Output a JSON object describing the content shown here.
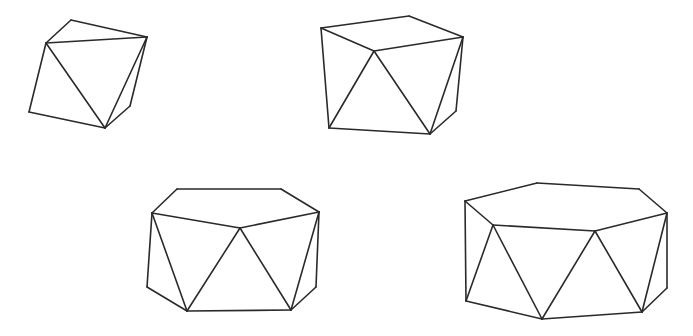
{
  "figure": {
    "background": "#ffffff",
    "stroke": "#2a2a2a",
    "polyhedra": [
      {
        "name": "polyhedron-1",
        "vertices": [
          [
            71,
            20
          ],
          [
            46,
            43
          ],
          [
            147,
            37
          ],
          [
            29,
            112
          ],
          [
            105,
            128
          ],
          [
            130,
            106
          ]
        ],
        "edges": [
          [
            0,
            2
          ],
          [
            0,
            1
          ],
          [
            1,
            2
          ],
          [
            1,
            3
          ],
          [
            3,
            4
          ],
          [
            1,
            4
          ],
          [
            4,
            2
          ],
          [
            4,
            5
          ],
          [
            5,
            2
          ]
        ]
      },
      {
        "name": "polyhedron-2",
        "vertices": [
          [
            321,
            28
          ],
          [
            409,
            16
          ],
          [
            463,
            37
          ],
          [
            374,
            51
          ],
          [
            329,
            128
          ],
          [
            430,
            134
          ],
          [
            456,
            111
          ]
        ],
        "edges": [
          [
            0,
            1
          ],
          [
            1,
            2
          ],
          [
            0,
            3
          ],
          [
            3,
            2
          ],
          [
            0,
            4
          ],
          [
            3,
            4
          ],
          [
            3,
            5
          ],
          [
            4,
            5
          ],
          [
            5,
            2
          ],
          [
            5,
            6
          ],
          [
            6,
            2
          ]
        ]
      },
      {
        "name": "polyhedron-3",
        "vertices": [
          [
            177,
            189
          ],
          [
            281,
            189
          ],
          [
            319,
            212
          ],
          [
            152,
            213
          ],
          [
            240,
            228
          ],
          [
            147,
            287
          ],
          [
            187,
            311
          ],
          [
            291,
            310
          ],
          [
            316,
            287
          ]
        ],
        "edges": [
          [
            0,
            1
          ],
          [
            1,
            2
          ],
          [
            0,
            3
          ],
          [
            3,
            4
          ],
          [
            4,
            2
          ],
          [
            3,
            5
          ],
          [
            5,
            6
          ],
          [
            3,
            6
          ],
          [
            6,
            4
          ],
          [
            6,
            7
          ],
          [
            4,
            7
          ],
          [
            7,
            2
          ],
          [
            7,
            8
          ],
          [
            8,
            2
          ]
        ]
      },
      {
        "name": "polyhedron-4",
        "vertices": [
          [
            465,
            201
          ],
          [
            537,
            183
          ],
          [
            639,
            189
          ],
          [
            667,
            213
          ],
          [
            493,
            225
          ],
          [
            595,
            231
          ],
          [
            466,
            301
          ],
          [
            542,
            319
          ],
          [
            642,
            312
          ],
          [
            667,
            288
          ]
        ],
        "edges": [
          [
            0,
            1
          ],
          [
            1,
            2
          ],
          [
            2,
            3
          ],
          [
            0,
            4
          ],
          [
            4,
            5
          ],
          [
            5,
            3
          ],
          [
            0,
            6
          ],
          [
            6,
            4
          ],
          [
            4,
            7
          ],
          [
            6,
            7
          ],
          [
            7,
            5
          ],
          [
            5,
            8
          ],
          [
            7,
            8
          ],
          [
            8,
            3
          ],
          [
            8,
            9
          ],
          [
            9,
            3
          ]
        ]
      }
    ]
  }
}
